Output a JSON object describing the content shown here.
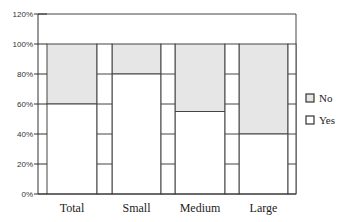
{
  "chart_data": {
    "type": "bar",
    "stacked": true,
    "percent": true,
    "title": "",
    "xlabel": "",
    "ylabel": "",
    "categories": [
      "Total",
      "Small",
      "Medium",
      "Large"
    ],
    "series": [
      {
        "name": "Yes",
        "values": [
          60,
          80,
          55,
          40
        ],
        "color": "#ffffff"
      },
      {
        "name": "No",
        "values": [
          40,
          20,
          45,
          60
        ],
        "color": "#e6e6e6"
      }
    ],
    "yticks": [
      "0%",
      "20%",
      "40%",
      "60%",
      "80%",
      "100%",
      "120%"
    ],
    "ylim": [
      0,
      120
    ],
    "grid": false,
    "legend": {
      "position": "right",
      "entries": [
        "No",
        "Yes"
      ]
    }
  },
  "colors": {
    "axis": "#333333",
    "no_fill": "#e6e6e6",
    "yes_fill": "#ffffff",
    "border": "#444444"
  }
}
